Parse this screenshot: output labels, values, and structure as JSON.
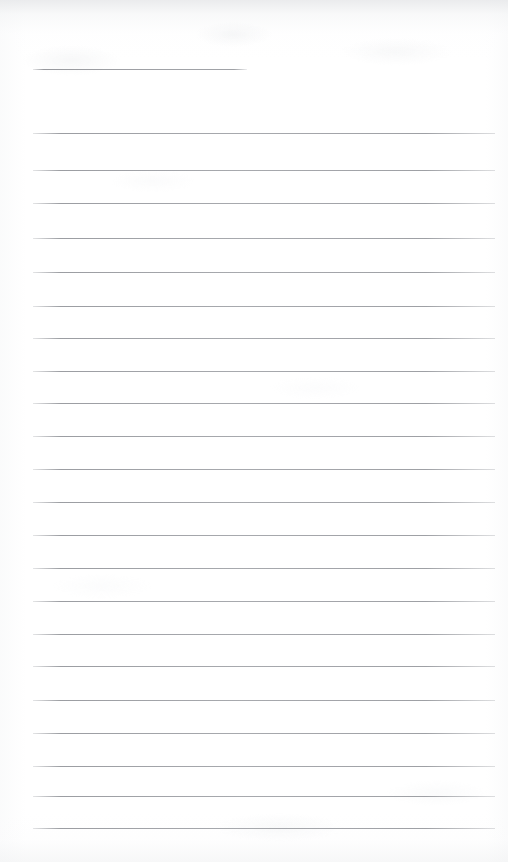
{
  "document": {
    "kind": "scanned-ruled-notepad-page",
    "title": "Blank ruled notepad page",
    "content_text": "",
    "page_width": 508,
    "page_height": 862,
    "background_color": "#ffffff",
    "rule_color": "#9a9ca1",
    "rule_thickness_px": 1,
    "rule_left_x": 33,
    "rule_right_x": 495,
    "rule_count": 23,
    "rules": [
      {
        "index": 1,
        "y": 69,
        "x_start": 33,
        "x_end": 247,
        "full_width": false
      },
      {
        "index": 2,
        "y": 133,
        "x_start": 33,
        "x_end": 495,
        "full_width": true
      },
      {
        "index": 3,
        "y": 170,
        "x_start": 33,
        "x_end": 495,
        "full_width": true
      },
      {
        "index": 4,
        "y": 203,
        "x_start": 33,
        "x_end": 495,
        "full_width": true
      },
      {
        "index": 5,
        "y": 238,
        "x_start": 33,
        "x_end": 495,
        "full_width": true
      },
      {
        "index": 6,
        "y": 272,
        "x_start": 33,
        "x_end": 495,
        "full_width": true
      },
      {
        "index": 7,
        "y": 306,
        "x_start": 33,
        "x_end": 495,
        "full_width": true
      },
      {
        "index": 8,
        "y": 338,
        "x_start": 33,
        "x_end": 495,
        "full_width": true
      },
      {
        "index": 9,
        "y": 371,
        "x_start": 33,
        "x_end": 495,
        "full_width": true
      },
      {
        "index": 10,
        "y": 403,
        "x_start": 33,
        "x_end": 495,
        "full_width": true
      },
      {
        "index": 11,
        "y": 436,
        "x_start": 33,
        "x_end": 495,
        "full_width": true
      },
      {
        "index": 12,
        "y": 469,
        "x_start": 33,
        "x_end": 495,
        "full_width": true
      },
      {
        "index": 13,
        "y": 502,
        "x_start": 33,
        "x_end": 495,
        "full_width": true
      },
      {
        "index": 14,
        "y": 535,
        "x_start": 33,
        "x_end": 495,
        "full_width": true
      },
      {
        "index": 15,
        "y": 568,
        "x_start": 33,
        "x_end": 495,
        "full_width": true
      },
      {
        "index": 16,
        "y": 601,
        "x_start": 33,
        "x_end": 495,
        "full_width": true
      },
      {
        "index": 17,
        "y": 634,
        "x_start": 33,
        "x_end": 495,
        "full_width": true
      },
      {
        "index": 18,
        "y": 666,
        "x_start": 33,
        "x_end": 495,
        "full_width": true
      },
      {
        "index": 19,
        "y": 700,
        "x_start": 33,
        "x_end": 495,
        "full_width": true
      },
      {
        "index": 20,
        "y": 733,
        "x_start": 33,
        "x_end": 495,
        "full_width": true
      },
      {
        "index": 21,
        "y": 766,
        "x_start": 33,
        "x_end": 495,
        "full_width": true
      },
      {
        "index": 22,
        "y": 796,
        "x_start": 33,
        "x_end": 495,
        "full_width": true
      },
      {
        "index": 23,
        "y": 828,
        "x_start": 33,
        "x_end": 495,
        "full_width": true
      }
    ]
  }
}
